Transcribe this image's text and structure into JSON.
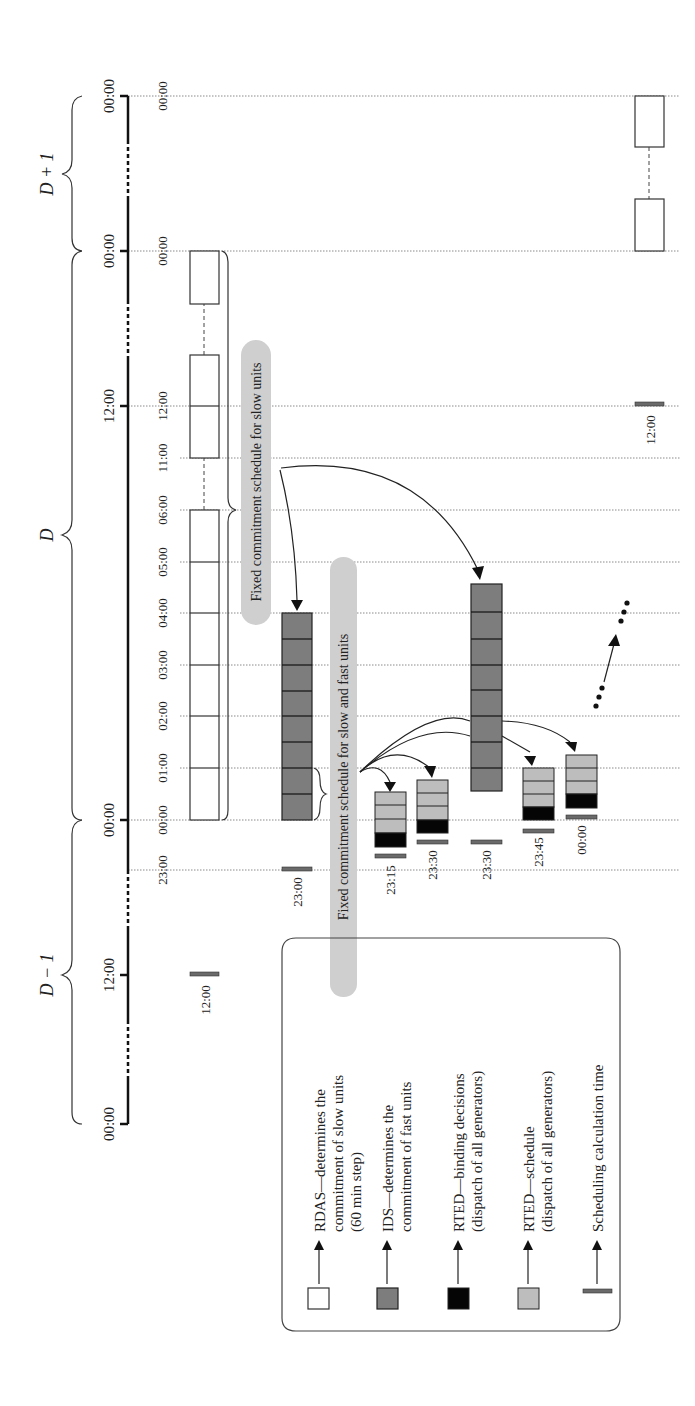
{
  "diagram": {
    "orientation": "rotated-90-ccw",
    "days": [
      {
        "label": "D − 1",
        "start": "00:00",
        "mid": "12:00",
        "end": "00:00"
      },
      {
        "label": "D",
        "start": "00:00",
        "mid": "12:00",
        "end": "00:00"
      },
      {
        "label": "D + 1",
        "start": "00:00",
        "end": "00:00"
      }
    ],
    "axis_ticks": {
      "d_minus_1_start": "00:00",
      "d_minus_1_mid": "12:00",
      "d_start": "00:00",
      "d_mid": "12:00",
      "d_end": "00:00",
      "d_plus_1_end": "00:00"
    },
    "grid_labels": {
      "t2300": "23:00",
      "t0000": "00:00",
      "t0100": "01:00",
      "t0200": "02:00",
      "t0300": "03:00",
      "t0400": "04:00",
      "t0500": "05:00",
      "t0600": "06:00",
      "t1100": "11:00",
      "t1200": "12:00",
      "t2400": "00:00",
      "t_next": "00:00"
    },
    "calc_time_labels": {
      "rdas_d_minus_1": "12:00",
      "ids_1": "23:00",
      "rted_1": "23:15",
      "rted_2": "23:30",
      "ids_2": "23:30",
      "rted_3": "23:45",
      "rted_4": "00:00",
      "rdas_d": "12:00"
    },
    "callouts": {
      "slow_units": "Fixed commitment schedule for slow units",
      "slow_fast_units": "Fixed commitment schedule for slow and fast units"
    },
    "continuation": "…"
  },
  "legend": {
    "items": [
      {
        "key": "rdas",
        "lines": [
          "RDAS—determines the",
          "commitment of slow units",
          "(60 min step)"
        ],
        "color": "#ffffff"
      },
      {
        "key": "ids",
        "lines": [
          "IDS—determines the",
          "commitment of fast units"
        ],
        "color": "#7d7d7d"
      },
      {
        "key": "rted-binding",
        "lines": [
          "RTED—binding decisions",
          "(dispatch of all generators)"
        ],
        "color": "#050505"
      },
      {
        "key": "rted-schedule",
        "lines": [
          "RTED—schedule",
          "(dispatch of all generators)"
        ],
        "color": "#bdbdbd"
      },
      {
        "key": "calc-time",
        "lines": [
          "Scheduling calculation time"
        ],
        "color": "#6a6a6a"
      }
    ]
  }
}
